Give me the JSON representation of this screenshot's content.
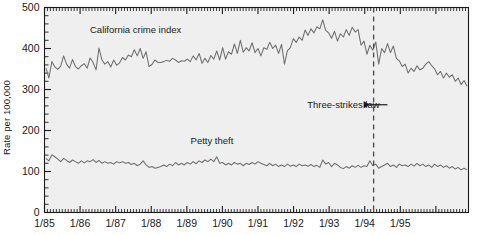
{
  "chart_data": {
    "type": "line",
    "title": "",
    "xlabel": "",
    "ylabel": "Rate per 100,000",
    "ylim": [
      0,
      500
    ],
    "yticks": [
      0,
      100,
      200,
      300,
      400,
      500
    ],
    "ytick_labels": [
      "0",
      "100",
      "200",
      "300",
      "400",
      "500"
    ],
    "xlim": [
      "1/85",
      "12/95"
    ],
    "xtick_labels": [
      "1/85",
      "1/86",
      "1/87",
      "1/88",
      "1/89",
      "1/90",
      "1/91",
      "1/92",
      "1/93",
      "1/94",
      "1/95"
    ],
    "x_minor_ticks": "monthly",
    "grid": false,
    "legend": "inline-labels",
    "annotations": [
      {
        "name": "california-crime-index-label",
        "text": "California crime index",
        "x_frac": 0.215,
        "y_value": 438
      },
      {
        "name": "petty-theft-label",
        "text": "Petty theft",
        "x_frac": 0.395,
        "y_value": 168
      },
      {
        "name": "three-strikes-law-label",
        "text": "Three-strikes law",
        "x_frac": 0.705,
        "y_value": 255,
        "arrow": "→"
      }
    ],
    "vlines": [
      {
        "name": "three-strikes-law-line",
        "label": "Three-strikes law",
        "x_month_index": 111,
        "style": "dashed"
      }
    ],
    "series": [
      {
        "name": "California crime index",
        "color": "#6e6e6e",
        "values": [
          352,
          328,
          368,
          355,
          349,
          357,
          382,
          362,
          352,
          373,
          356,
          350,
          358,
          363,
          352,
          377,
          366,
          348,
          401,
          372,
          362,
          368,
          355,
          372,
          359,
          365,
          378,
          372,
          384,
          380,
          397,
          382,
          400,
          376,
          392,
          356,
          361,
          372,
          366,
          366,
          368,
          371,
          369,
          376,
          372,
          366,
          370,
          369,
          374,
          368,
          382,
          372,
          388,
          364,
          376,
          366,
          383,
          374,
          394,
          372,
          402,
          374,
          392,
          386,
          411,
          388,
          420,
          391,
          402,
          394,
          414,
          390,
          400,
          382,
          402,
          398,
          415,
          400,
          408,
          388,
          410,
          362,
          395,
          402,
          424,
          415,
          428,
          420,
          445,
          432,
          448,
          438,
          453,
          448,
          470,
          444,
          438,
          425,
          442,
          418,
          436,
          428,
          446,
          432,
          452,
          440,
          446,
          408,
          418,
          386,
          408,
          396,
          416,
          362,
          400,
          390,
          412,
          390,
          406,
          376,
          370,
          356,
          362,
          340,
          352,
          344,
          358,
          348,
          352,
          362,
          368,
          358,
          350,
          336,
          344,
          328,
          340,
          330,
          336,
          320,
          328,
          312,
          322,
          308
        ]
      },
      {
        "name": "Petty theft",
        "color": "#6e6e6e",
        "values": [
          132,
          126,
          141,
          136,
          130,
          124,
          132,
          127,
          122,
          128,
          124,
          120,
          126,
          121,
          126,
          124,
          129,
          122,
          127,
          120,
          124,
          120,
          122,
          118,
          124,
          121,
          124,
          120,
          122,
          117,
          120,
          114,
          118,
          126,
          116,
          110,
          112,
          108,
          110,
          112,
          116,
          112,
          118,
          114,
          122,
          116,
          120,
          116,
          122,
          118,
          124,
          119,
          126,
          122,
          128,
          124,
          130,
          124,
          136,
          120,
          122,
          116,
          120,
          116,
          122,
          118,
          120,
          114,
          120,
          117,
          122,
          118,
          124,
          120,
          117,
          114,
          120,
          114,
          118,
          112,
          116,
          112,
          118,
          113,
          116,
          112,
          118,
          114,
          116,
          113,
          117,
          112,
          115,
          110,
          128,
          118,
          122,
          112,
          120,
          116,
          110,
          107,
          112,
          108,
          114,
          110,
          115,
          110,
          114,
          112,
          126,
          114,
          118,
          108,
          112,
          116,
          120,
          112,
          116,
          110,
          118,
          114,
          116,
          112,
          118,
          113,
          120,
          114,
          118,
          112,
          116,
          110,
          118,
          112,
          116,
          110,
          114,
          108,
          112,
          106,
          110,
          104,
          108,
          104
        ]
      }
    ]
  }
}
